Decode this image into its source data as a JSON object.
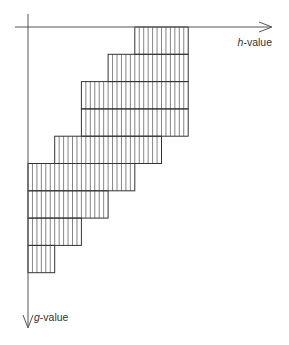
{
  "diagram": {
    "type": "staircase-hatched-region",
    "axes": {
      "horizontal": {
        "label_var": "h",
        "label_suffix": "-value",
        "direction": "right"
      },
      "vertical": {
        "label_var": "g",
        "label_suffix": "-value",
        "direction": "down"
      }
    },
    "grid": {
      "origin_x": 28,
      "origin_y": 27,
      "cell_w": 26.7,
      "cell_h": 27.3,
      "stripes_per_cell": 6
    },
    "rows": [
      {
        "row": 0,
        "col_start": 4,
        "col_end": 6
      },
      {
        "row": 1,
        "col_start": 3,
        "col_end": 6
      },
      {
        "row": 2,
        "col_start": 2,
        "col_end": 6
      },
      {
        "row": 3,
        "col_start": 2,
        "col_end": 6
      },
      {
        "row": 4,
        "col_start": 1,
        "col_end": 5
      },
      {
        "row": 5,
        "col_start": 0,
        "col_end": 4
      },
      {
        "row": 6,
        "col_start": 0,
        "col_end": 3
      },
      {
        "row": 7,
        "col_start": 0,
        "col_end": 2
      },
      {
        "row": 8,
        "col_start": 0,
        "col_end": 1
      }
    ],
    "colors": {
      "axis": "#555555",
      "outline": "#333333",
      "hatch": "#666666"
    }
  }
}
